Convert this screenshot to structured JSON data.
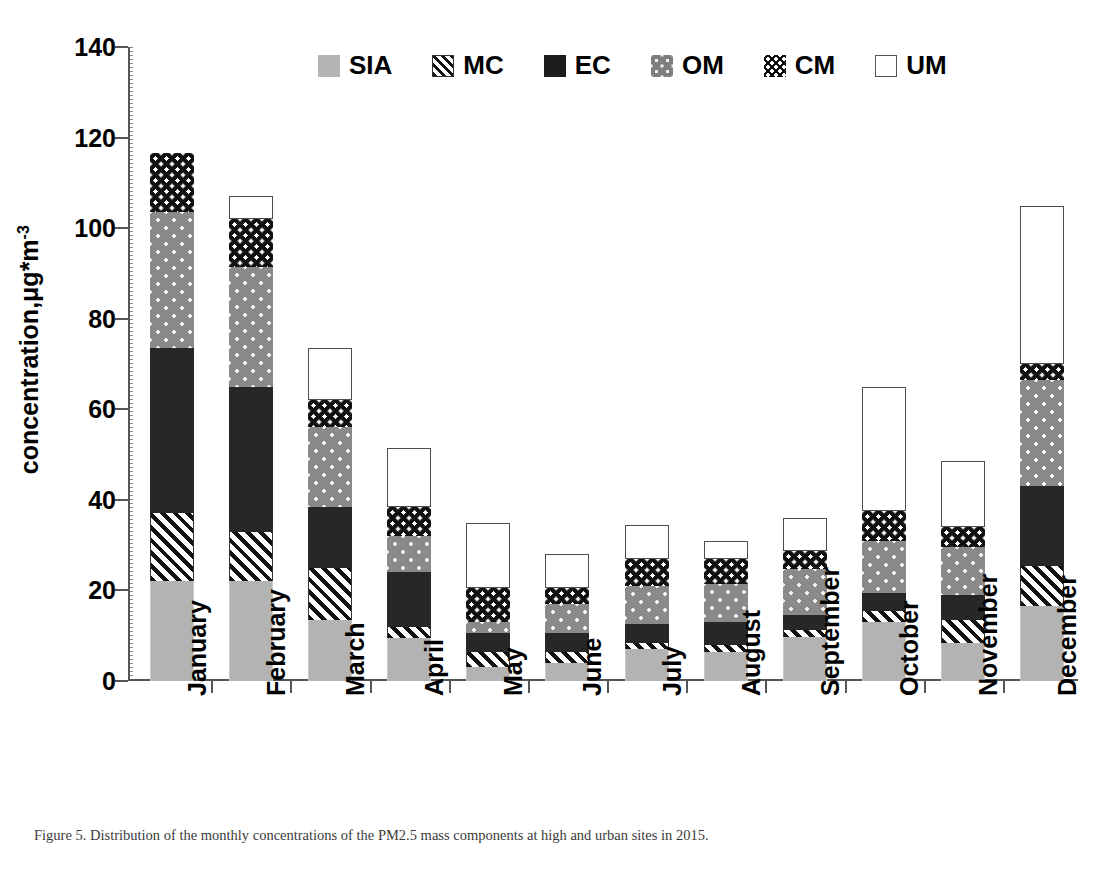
{
  "chart_data": {
    "type": "bar",
    "stacked": true,
    "title": "",
    "xlabel": "",
    "ylabel": "concentration,μg*m",
    "ylabel_sup": "-3",
    "ylim": [
      0,
      140
    ],
    "ytick_step": 20,
    "yticks": [
      0,
      20,
      40,
      60,
      80,
      100,
      120,
      140
    ],
    "grid": false,
    "legend_position": "top-center",
    "categories": [
      "January",
      "February",
      "March",
      "April",
      "May",
      "June",
      "July",
      "August",
      "September",
      "October",
      "November",
      "December"
    ],
    "series": [
      {
        "name": "SIA",
        "pattern": "solid-grey",
        "color": "#b3b3b3",
        "values": [
          22.0,
          22.0,
          13.5,
          9.5,
          3.0,
          4.0,
          7.0,
          6.5,
          9.7,
          13.0,
          8.5,
          16.5
        ]
      },
      {
        "name": "MC",
        "pattern": "diagonal-hatch",
        "color": "#111111",
        "values": [
          15.0,
          11.0,
          11.5,
          2.5,
          3.5,
          2.5,
          1.5,
          1.5,
          1.5,
          2.5,
          5.0,
          9.0
        ]
      },
      {
        "name": "EC",
        "pattern": "solid-black",
        "color": "#272727",
        "values": [
          36.5,
          32.0,
          13.5,
          12.0,
          4.0,
          4.0,
          4.0,
          5.0,
          3.3,
          4.0,
          5.5,
          17.5
        ]
      },
      {
        "name": "OM",
        "pattern": "grey-dots",
        "color": "#8a8a8a",
        "values": [
          30.0,
          26.5,
          17.5,
          8.0,
          2.5,
          6.5,
          8.5,
          8.5,
          10.3,
          11.5,
          10.5,
          23.5
        ]
      },
      {
        "name": "CM",
        "pattern": "black-dots",
        "color": "#111111",
        "values": [
          13.0,
          10.5,
          6.0,
          6.5,
          7.5,
          3.5,
          6.0,
          5.5,
          4.0,
          6.5,
          4.5,
          3.5
        ]
      },
      {
        "name": "UM",
        "pattern": "empty-white",
        "color": "#ffffff",
        "values": [
          0.0,
          5.0,
          11.5,
          13.0,
          14.5,
          7.5,
          7.5,
          4.0,
          7.2,
          27.5,
          14.5,
          35.0
        ]
      }
    ],
    "totals": [
      116.5,
      107.0,
      73.5,
      51.5,
      35.0,
      28.0,
      34.5,
      31.0,
      36.0,
      65.0,
      48.5,
      105.0
    ]
  },
  "legend": {
    "items": [
      {
        "label": "SIA",
        "swatch": "sia"
      },
      {
        "label": "MC",
        "swatch": "mc"
      },
      {
        "label": "EC",
        "swatch": "ec"
      },
      {
        "label": "OM",
        "swatch": "om"
      },
      {
        "label": "CM",
        "swatch": "cm"
      },
      {
        "label": "UM",
        "swatch": "um"
      }
    ]
  },
  "caption": {
    "text": "Figure 5. Distribution of the monthly concentrations of the PM2.5 mass components at high and urban sites in 2015."
  }
}
